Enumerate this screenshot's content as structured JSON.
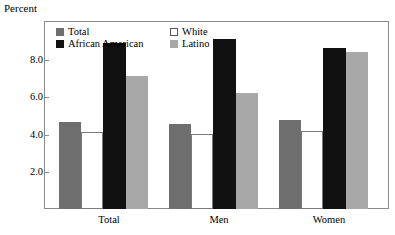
{
  "chart_data": {
    "type": "bar",
    "title": "",
    "xlabel": "",
    "ylabel": "Percent",
    "categories": [
      "Total",
      "Men",
      "Women"
    ],
    "ylim": [
      0.0,
      9.0
    ],
    "yticks": [
      "2.0",
      "4.0",
      "6.0",
      "8.0"
    ],
    "ytick_values": [
      2.0,
      4.0,
      6.0,
      8.0
    ],
    "grid": false,
    "legend_position": "top-inside",
    "series": [
      {
        "name": "Total",
        "color": "#6e6e6e",
        "values": [
          4.2,
          4.1,
          4.3
        ]
      },
      {
        "name": "White",
        "color": "#ffffff",
        "values": [
          3.7,
          3.6,
          3.75
        ]
      },
      {
        "name": "African American",
        "color": "#111111",
        "values": [
          8.0,
          8.2,
          7.75
        ]
      },
      {
        "name": "Latino",
        "color": "#a8a8a8",
        "values": [
          6.4,
          5.6,
          7.55
        ]
      }
    ]
  },
  "axis": {
    "ylabel": "Percent",
    "yticks": [
      "2.0",
      "4.0",
      "6.0",
      "8.0"
    ],
    "xticks": [
      "Total",
      "Men",
      "Women"
    ]
  },
  "legend": {
    "entries": [
      {
        "label": "Total",
        "color": "#6e6e6e"
      },
      {
        "label": "White",
        "color": "#ffffff"
      },
      {
        "label": "African American",
        "color": "#111111"
      },
      {
        "label": "Latino",
        "color": "#a8a8a8"
      }
    ]
  },
  "colors": {
    "total": "#6e6e6e",
    "white": "#ffffff",
    "african_american": "#111111",
    "latino": "#a8a8a8",
    "frame": "#8a8a8a",
    "background": "#ffffff"
  }
}
